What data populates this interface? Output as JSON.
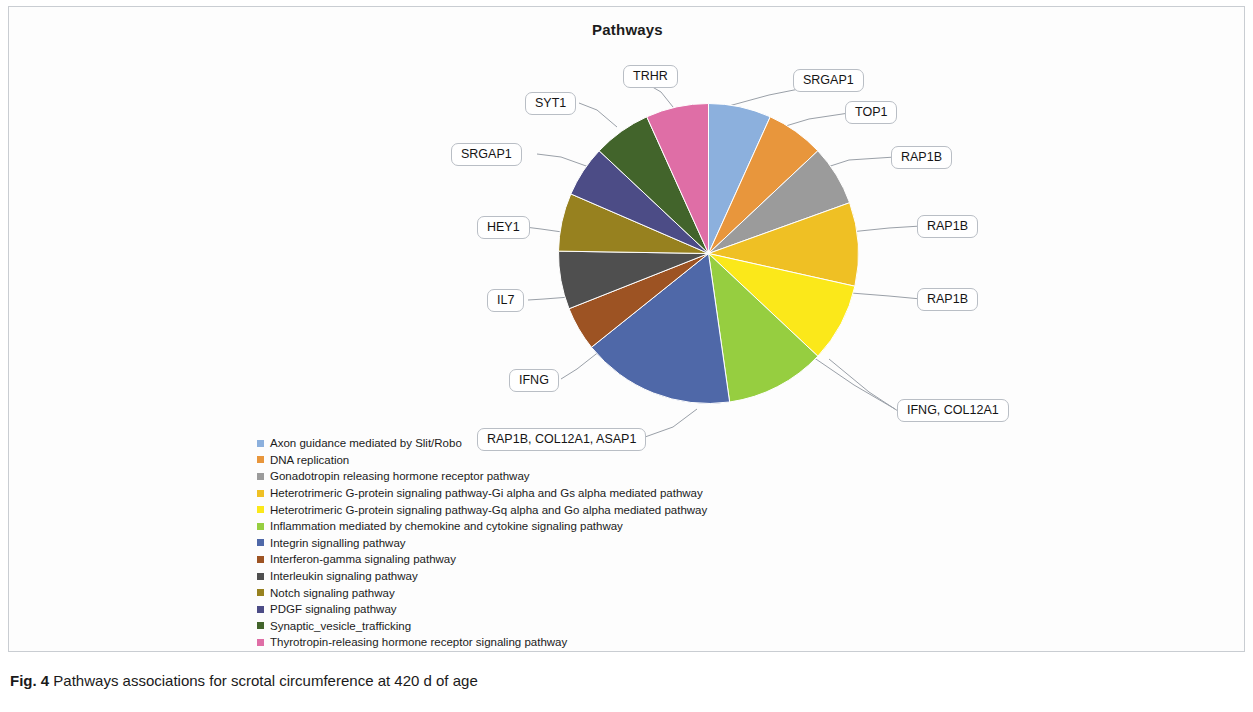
{
  "figure": {
    "chart_title": "Pathways",
    "caption_prefix": "Fig. 4",
    "caption_text": "Pathways associations for scrotal circumference at 420 d of age"
  },
  "callouts": [
    {
      "id": "srgap1-top",
      "text": "SRGAP1"
    },
    {
      "id": "top1",
      "text": "TOP1"
    },
    {
      "id": "rap1b-1",
      "text": "RAP1B"
    },
    {
      "id": "rap1b-2",
      "text": "RAP1B"
    },
    {
      "id": "rap1b-3",
      "text": "RAP1B"
    },
    {
      "id": "ifng-col12a1",
      "text": "IFNG, COL12A1"
    },
    {
      "id": "rap1b-col12a1-asap1",
      "text": "RAP1B, COL12A1, ASAP1"
    },
    {
      "id": "ifng",
      "text": "IFNG"
    },
    {
      "id": "il7",
      "text": "IL7"
    },
    {
      "id": "hey1",
      "text": "HEY1"
    },
    {
      "id": "srgap1-left",
      "text": "SRGAP1"
    },
    {
      "id": "syt1",
      "text": "SYT1"
    },
    {
      "id": "trhr",
      "text": "TRHR"
    }
  ],
  "chart_data": {
    "type": "pie",
    "title": "Pathways",
    "legend_position": "bottom-left",
    "grid": false,
    "categories": [
      "Axon guidance mediated by Slit/Robo",
      "DNA replication",
      "Gonadotropin releasing hormone receptor pathway",
      "Heterotrimeric G-protein signaling pathway-Gi alpha and Gs alpha mediated pathway",
      "Heterotrimeric G-protein signaling pathway-Gq alpha and Go alpha mediated pathway",
      "Inflammation mediated by chemokine and cytokine signaling pathway",
      "Integrin signalling pathway",
      "Interferon-gamma signaling pathway",
      "Interleukin signaling pathway",
      "Notch signaling pathway",
      "PDGF signaling pathway",
      "Synaptic_vesicle_trafficking",
      "Thyrotropin-releasing hormone receptor signaling pathway"
    ],
    "values": [
      27,
      25,
      26,
      36,
      34,
      43,
      66,
      19,
      25,
      25,
      22,
      25,
      27
    ],
    "colors": [
      "#8cb0dd",
      "#e8963c",
      "#9b9b9b",
      "#efc024",
      "#fbe81a",
      "#96ce40",
      "#4f68a8",
      "#9d5323",
      "#4f4f4f",
      "#97811f",
      "#4c4c86",
      "#42642b",
      "#df6ea6"
    ],
    "gene_labels": [
      "SRGAP1",
      "TOP1",
      "RAP1B",
      "RAP1B",
      "RAP1B",
      "IFNG, COL12A1",
      "RAP1B, COL12A1, ASAP1",
      "IFNG",
      "IL7",
      "HEY1",
      "SRGAP1",
      "SYT1",
      "TRHR"
    ]
  }
}
